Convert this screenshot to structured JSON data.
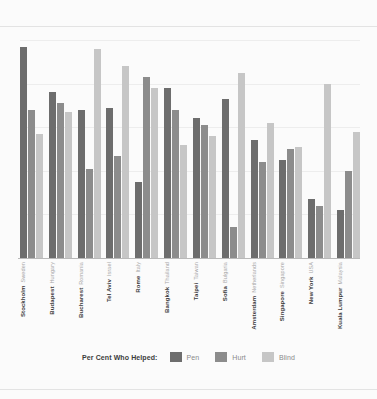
{
  "chart_data": {
    "type": "bar",
    "title": "",
    "subtitle": "",
    "xlabel": "",
    "ylabel": "",
    "ylim": [
      0,
      100
    ],
    "grid": true,
    "legend_position": "bottom",
    "legend_title": "Per Cent Who Helped:",
    "categories": [
      "Stockholm",
      "Budapest",
      "Bucharest",
      "Tel Aviv",
      "Rome",
      "Bangkok",
      "Taipei",
      "Sofia",
      "Amsterdam",
      "Singapore",
      "New York",
      "Kuala Lumpur"
    ],
    "countries": [
      "Sweden",
      "Hungary",
      "Romania",
      "Israel",
      "Italy",
      "Thailand",
      "Taiwan",
      "Bulgaria",
      "Netherlands",
      "Singapore",
      "USA",
      "Malaysia"
    ],
    "series": [
      {
        "name": "Pen",
        "color": "#6d6d6d",
        "values": [
          97,
          76,
          68,
          69,
          35,
          78,
          64,
          73,
          54,
          45,
          27,
          22
        ]
      },
      {
        "name": "Hurt",
        "color": "#8c8c8c",
        "values": [
          68,
          71,
          41,
          47,
          83,
          68,
          61,
          14,
          44,
          50,
          24,
          40
        ]
      },
      {
        "name": "Blind",
        "color": "#c6c6c6",
        "values": [
          57,
          67,
          96,
          88,
          78,
          52,
          56,
          85,
          62,
          51,
          80,
          58
        ]
      }
    ]
  },
  "legend": {
    "title": "Per Cent Who Helped:",
    "items": [
      {
        "label": "Pen",
        "color": "#6d6d6d",
        "key": "pen"
      },
      {
        "label": "Hurt",
        "color": "#8c8c8c",
        "key": "hurt"
      },
      {
        "label": "Blind",
        "color": "#c6c6c6",
        "key": "blind"
      }
    ]
  },
  "style": {
    "background": "#fbfbfb",
    "gridline_color": "#ededed",
    "axis_color": "#b9b9b9",
    "city_text_color": "#3c3c3c",
    "country_text_color": "#a8a8a8"
  }
}
